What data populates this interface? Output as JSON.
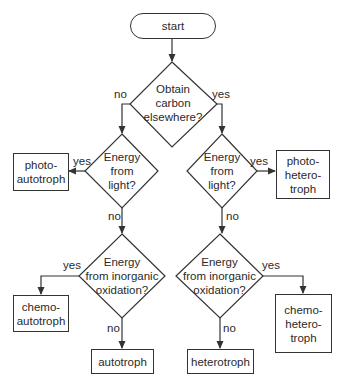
{
  "flowchart": {
    "start": "start",
    "decisions": {
      "carbon": "Obtain\ncarbon\nelsewhere?",
      "light_left": "Energy\nfrom\nlight?",
      "light_right": "Energy\nfrom\nlight?",
      "inorganic_left": "Energy\nfrom inorganic\noxidation?",
      "inorganic_right": "Energy\nfrom inorganic\noxidation?"
    },
    "outcomes": {
      "photoautotroph": "photo-\nautotroph",
      "photoheterotroph": "photo-\nhetero-\ntroph",
      "chemoautotroph": "chemo-\nautotroph",
      "chemoheterotroph": "chemo-\nhetero-\ntroph",
      "autotroph": "autotroph",
      "heterotroph": "heterotroph"
    },
    "edge_labels": {
      "yes": "yes",
      "no": "no"
    },
    "colors": {
      "stroke": "#333333",
      "text": "#2a2a2a",
      "background": "#ffffff"
    }
  }
}
